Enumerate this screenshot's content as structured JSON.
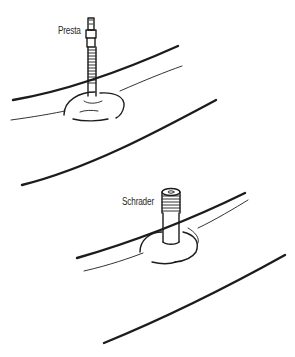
{
  "figure": {
    "labels": {
      "presta": "Presta",
      "schrader": "Schrader"
    },
    "colors": {
      "background": "#ffffff",
      "ink": "#1c1c1c"
    }
  }
}
